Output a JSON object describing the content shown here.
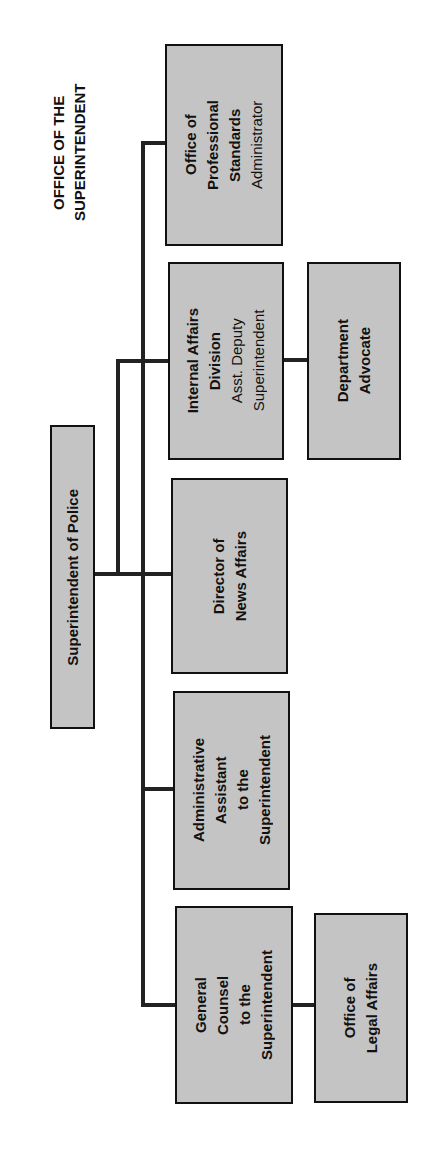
{
  "heading": "OFFICE OF THE\nSUPERINTENDENT",
  "root": {
    "title": "Superintendent of Police"
  },
  "units": [
    {
      "title": "Office of\nProfessional\nStandards",
      "subtitle": "Administrator"
    },
    {
      "title": "Internal Affairs\nDivision",
      "subtitle": "Asst. Deputy\nSuperintendent"
    },
    {
      "title": "Director of\nNews Affairs",
      "subtitle": ""
    },
    {
      "title": "Administrative\nAssistant\nto the\nSuperintendent",
      "subtitle": ""
    },
    {
      "title": "General\nCounsel\nto the\nSuperintendent",
      "subtitle": ""
    }
  ],
  "subunits": [
    {
      "parent": "Internal Affairs Division",
      "title": "Department\nAdvocate"
    },
    {
      "parent": "General Counsel to the Superintendent",
      "title": "Office of\nLegal Affairs"
    }
  ],
  "colors": {
    "box_fill": "#c4c4c4",
    "line": "#222222",
    "text": "#111111"
  }
}
